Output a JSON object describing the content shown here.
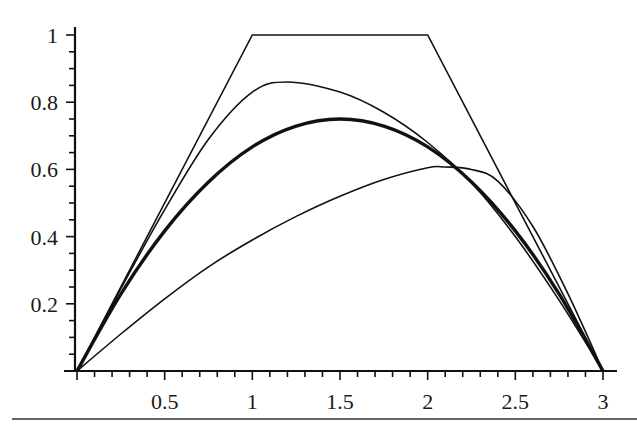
{
  "chart_data": {
    "type": "line",
    "title": "",
    "xlabel": "",
    "ylabel": "",
    "xlim": [
      0,
      3
    ],
    "ylim": [
      0,
      1
    ],
    "grid": false,
    "legend": null,
    "x_ticks": [
      0.5,
      1,
      1.5,
      2,
      2.5,
      3
    ],
    "x_tick_labels": [
      "0.5",
      "1",
      "1.5",
      "2",
      "2.5",
      "3"
    ],
    "y_ticks": [
      0.2,
      0.4,
      0.6,
      0.8,
      1
    ],
    "y_tick_labels": [
      "0.2",
      "0.4",
      "0.6",
      "0.8",
      "1"
    ],
    "x_minor_step": 0.1,
    "y_minor_step": 0.05,
    "series": [
      {
        "name": "trapezoid",
        "style": "thin",
        "x": [
          0,
          1,
          2,
          3
        ],
        "y": [
          0,
          1,
          1,
          0
        ]
      },
      {
        "name": "curve-peak-left",
        "style": "thin",
        "x": [
          0,
          0.25,
          0.5,
          0.75,
          1.0,
          1.2,
          1.5,
          1.75,
          2.0,
          2.25,
          2.5,
          2.75,
          3.0
        ],
        "y": [
          0,
          0.245,
          0.48,
          0.69,
          0.83,
          0.86,
          0.83,
          0.77,
          0.68,
          0.56,
          0.4,
          0.21,
          0
        ]
      },
      {
        "name": "curve-symmetric",
        "style": "thick",
        "x": [
          0,
          0.25,
          0.5,
          0.75,
          1.0,
          1.25,
          1.5,
          1.75,
          2.0,
          2.25,
          2.5,
          2.75,
          3.0
        ],
        "y": [
          0,
          0.229,
          0.417,
          0.5625,
          0.667,
          0.729,
          0.75,
          0.729,
          0.667,
          0.5625,
          0.417,
          0.229,
          0
        ]
      },
      {
        "name": "curve-peak-right",
        "style": "thin",
        "x": [
          0,
          0.25,
          0.5,
          0.75,
          1.0,
          1.25,
          1.5,
          1.75,
          2.0,
          2.1,
          2.25,
          2.4,
          2.6,
          2.8,
          3.0
        ],
        "y": [
          0,
          0.11,
          0.215,
          0.31,
          0.39,
          0.46,
          0.52,
          0.57,
          0.605,
          0.607,
          0.6,
          0.565,
          0.43,
          0.23,
          0
        ]
      }
    ]
  }
}
